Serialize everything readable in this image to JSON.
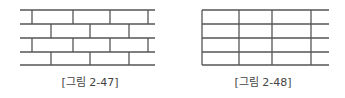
{
  "figures": [
    {
      "id": "fig-2-47",
      "caption": "[그림 2-47]",
      "type": "running-bond-brick-pattern",
      "rows": 4,
      "h_lines_y": [
        10,
        24,
        38,
        52,
        65
      ],
      "x_range": [
        20,
        155
      ],
      "row_verticals": [
        [
          32,
          73,
          110,
          148
        ],
        [
          51,
          90,
          129
        ],
        [
          32,
          73,
          110,
          148
        ],
        [
          51,
          90,
          129
        ]
      ]
    },
    {
      "id": "fig-2-48",
      "caption": "[그림 2-48]",
      "type": "stack-bond-grid-pattern",
      "rows": 4,
      "h_lines_y": [
        10,
        24,
        38,
        52,
        65
      ],
      "x_range": [
        202,
        329
      ],
      "verticals": [
        202,
        239,
        272,
        311
      ]
    }
  ],
  "colors": {
    "line": "#555555",
    "caption": "#444444"
  }
}
